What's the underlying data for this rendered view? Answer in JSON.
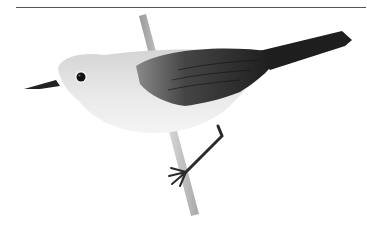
{
  "image": {
    "subject": "Grey-and-white songbird with dark wings and tail perched on a slender twig",
    "style": "greyscale naturalist illustration",
    "elements": {
      "top_rule": "thin horizontal line",
      "bird": {
        "head": "pale grey",
        "eye": "black with white eye-ring",
        "bill": "dark, slender, pointed",
        "underparts": "white/very pale grey",
        "wings_and_tail": "dark grey to black, with feather detail",
        "legs": "dark, gripping twig"
      },
      "perch": "thin diagonal twig"
    },
    "colors": {
      "background": "#ffffff",
      "head": "#d8d8d8",
      "underparts": "#ececec",
      "wing": "#3a3a3a",
      "tail": "#1e1e1e",
      "bill": "#222222",
      "twig": "#b8b8b8",
      "rule": "#555555"
    }
  }
}
